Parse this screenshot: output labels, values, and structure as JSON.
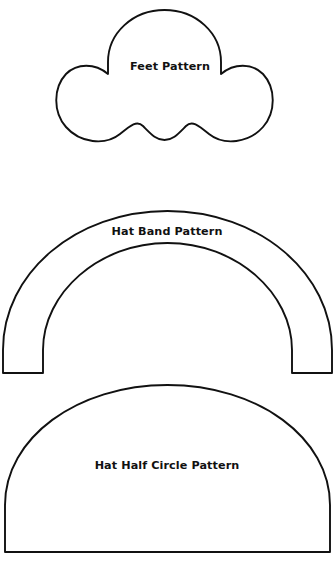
{
  "page": {
    "background_color": "#ffffff",
    "stroke_color": "#111111",
    "fill_color": "#ffffff",
    "width": 335,
    "height": 567
  },
  "patterns": [
    {
      "id": "feet-pattern",
      "label": "Feet Pattern",
      "shape": "three-lobed-foot",
      "label_x": 170,
      "label_y": 67,
      "bounds": {
        "x": 57,
        "y": 10,
        "width": 215,
        "height": 153
      },
      "path": "M 164.5 10 C 196 10 221 33 221 62 L 221 74 C 234 63 252 63 263 74 C 276 88 276 112 263 127 C 249 143 224 146 209 134 C 198 125 192 120 186 126 C 178 134 173 140 164.5 140 C 156 140 151 134 143 126 C 137 120 131 125 120 134 C 105 146 80 143 66 127 C 53 112 53 88 66 74 C 77 63 95 63 108 74 L 108 62 C 108 33 133 10 164.5 10 Z"
    },
    {
      "id": "hat-band-pattern",
      "label": "Hat Band Pattern",
      "shape": "arch-band",
      "label_x": 167,
      "label_y": 232,
      "bounds": {
        "x": 3,
        "y": 211,
        "width": 329,
        "height": 162
      },
      "band_thickness": 32,
      "outer_left_x": 3,
      "outer_right_x": 332,
      "inner_left_x": 43,
      "inner_right_x": 292,
      "arch_top_y": 211,
      "inner_top_y": 243,
      "leg_bottom_y": 373,
      "path": "M 3 373 L 3 350 C 3 273 76 211 167.5 211 C 259 211 332 273 332 350 L 332 373 L 292 373 L 292 350 C 292 293 236 243 167.5 243 C 99 243 43 293 43 350 L 43 373 Z"
    },
    {
      "id": "hat-half-circle-pattern",
      "label": "Hat Half Circle Pattern",
      "shape": "semi-ellipse",
      "label_x": 167,
      "label_y": 466,
      "bounds": {
        "x": 5,
        "y": 385,
        "width": 325,
        "height": 167
      },
      "flat_bottom_y": 552,
      "apex_y": 385,
      "path": "M 5 552 L 5 505 C 5 438 77 385 167.5 385 C 258 385 330 438 330 505 L 330 552 Z"
    }
  ]
}
